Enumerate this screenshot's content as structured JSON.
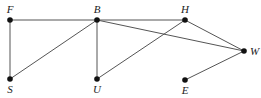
{
  "diagram": {
    "type": "graph",
    "nodes": [
      {
        "id": "F",
        "label": "F",
        "x": 10,
        "y": 20,
        "lx": 10,
        "ly": 13,
        "anchor": "middle"
      },
      {
        "id": "S",
        "label": "S",
        "x": 10,
        "y": 79,
        "lx": 10,
        "ly": 93,
        "anchor": "middle"
      },
      {
        "id": "B",
        "label": "B",
        "x": 97,
        "y": 20,
        "lx": 97,
        "ly": 13,
        "anchor": "middle"
      },
      {
        "id": "U",
        "label": "U",
        "x": 97,
        "y": 79,
        "lx": 97,
        "ly": 93,
        "anchor": "middle"
      },
      {
        "id": "H",
        "label": "H",
        "x": 185,
        "y": 20,
        "lx": 185,
        "ly": 13,
        "anchor": "middle"
      },
      {
        "id": "W",
        "label": "W",
        "x": 244,
        "y": 51,
        "lx": 250,
        "ly": 55,
        "anchor": "start"
      },
      {
        "id": "E",
        "label": "E",
        "x": 185,
        "y": 80,
        "lx": 185,
        "ly": 94,
        "anchor": "middle"
      }
    ],
    "edges": [
      [
        "F",
        "B"
      ],
      [
        "F",
        "S"
      ],
      [
        "S",
        "B"
      ],
      [
        "B",
        "U"
      ],
      [
        "B",
        "H"
      ],
      [
        "B",
        "W"
      ],
      [
        "U",
        "H"
      ],
      [
        "H",
        "W"
      ],
      [
        "W",
        "E"
      ]
    ]
  }
}
